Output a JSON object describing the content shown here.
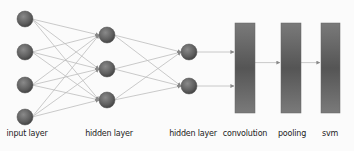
{
  "diagram": {
    "type": "neural-network-pipeline",
    "layers": [
      {
        "id": "input",
        "label": "input layer",
        "kind": "nodes",
        "count": 4,
        "x": 25,
        "ys": [
          19,
          52,
          85,
          117
        ]
      },
      {
        "id": "hidden1",
        "label": "hidden layer",
        "kind": "nodes",
        "count": 3,
        "x": 107,
        "ys": [
          35,
          69,
          100
        ]
      },
      {
        "id": "hidden2",
        "label": "hidden layer",
        "kind": "nodes",
        "count": 2,
        "x": 189,
        "ys": [
          52,
          86
        ]
      },
      {
        "id": "convolution",
        "label": "convolution",
        "kind": "block",
        "x": 235,
        "y": 23,
        "w": 20,
        "h": 90
      },
      {
        "id": "pooling",
        "label": "pooling",
        "kind": "block",
        "x": 281,
        "y": 23,
        "w": 20,
        "h": 90
      },
      {
        "id": "svm",
        "label": "svm",
        "kind": "block",
        "x": 321,
        "y": 23,
        "w": 19,
        "h": 90
      }
    ],
    "connections": [
      {
        "from": "input",
        "to": "hidden1",
        "type": "fully-connected"
      },
      {
        "from": "hidden1",
        "to": "hidden2",
        "type": "fully-connected"
      },
      {
        "from": "hidden2",
        "to": "convolution",
        "type": "arrows"
      },
      {
        "from": "convolution",
        "to": "pooling",
        "type": "arrow"
      },
      {
        "from": "pooling",
        "to": "svm",
        "type": "arrow"
      }
    ],
    "colors": {
      "node": "#6e6e6e",
      "node_dark": "#4a4a4a",
      "block": "#6a6a6a",
      "edge": "#b8b8b8"
    }
  },
  "labels": {
    "input": "input layer",
    "hidden1": "hidden layer",
    "hidden2": "hidden layer",
    "convolution": "convolution",
    "pooling": "pooling",
    "svm": "svm"
  }
}
